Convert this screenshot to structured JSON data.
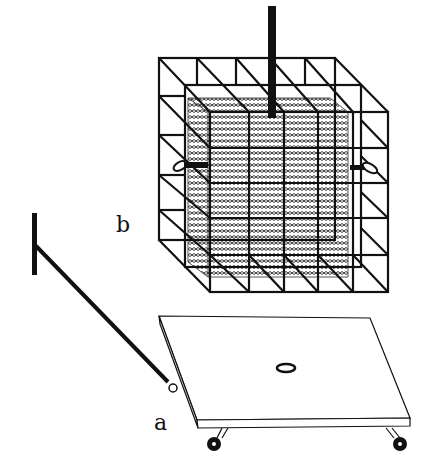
{
  "figure": {
    "labels": {
      "a": "a",
      "b": "b"
    },
    "parts": {
      "a": "wheeled platform with pull handle",
      "b": "cage frame enclosing netted box with top pole"
    },
    "colors": {
      "line": "#111111",
      "background": "#ffffff"
    }
  }
}
